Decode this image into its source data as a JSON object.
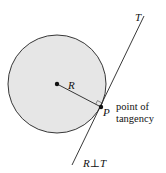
{
  "diagram": {
    "labels": {
      "tangent": "T",
      "radius": "R",
      "point": "P",
      "point_desc_line1": "point of",
      "point_desc_line2": "tangency",
      "relation": "R⊥T"
    },
    "colors": {
      "circle_fill": "#e6e6e6",
      "stroke": "#222222",
      "background": "#ffffff"
    },
    "geometry": {
      "circle": {
        "cx": 57,
        "cy": 84,
        "r": 49
      },
      "center": {
        "x": 57,
        "y": 84
      },
      "point_of_tangency": {
        "x": 101,
        "y": 107
      },
      "tangent_line": {
        "x1": 144,
        "y1": 16,
        "x2": 72,
        "y2": 165
      }
    }
  }
}
